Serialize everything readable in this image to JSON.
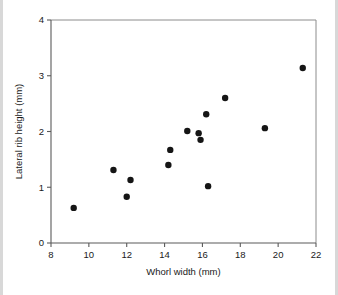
{
  "chart_data": {
    "type": "scatter",
    "title": "",
    "subtitle": "",
    "xlabel": "Whorl width (mm)",
    "ylabel": "Lateral rib height (mm)",
    "xlim": [
      8,
      22
    ],
    "ylim": [
      0,
      4
    ],
    "xticks": [
      8,
      10,
      12,
      14,
      16,
      18,
      20,
      22
    ],
    "yticks": [
      0,
      1,
      2,
      3,
      4
    ],
    "xtick_labels": [
      "8",
      "10",
      "12",
      "14",
      "16",
      "18",
      "20",
      "22"
    ],
    "ytick_labels": [
      "0",
      "1",
      "2",
      "3",
      "4"
    ],
    "grid": false,
    "legend": null,
    "legend_position": "none",
    "marker": "filled-circle",
    "marker_color": "#151515",
    "marker_size": 3.2,
    "n_points": 14,
    "points": [
      {
        "x": 9.2,
        "y": 0.63
      },
      {
        "x": 11.3,
        "y": 1.31
      },
      {
        "x": 12.0,
        "y": 0.83
      },
      {
        "x": 12.2,
        "y": 1.13
      },
      {
        "x": 14.2,
        "y": 1.4
      },
      {
        "x": 14.3,
        "y": 1.67
      },
      {
        "x": 15.2,
        "y": 2.01
      },
      {
        "x": 15.8,
        "y": 1.97
      },
      {
        "x": 15.9,
        "y": 1.85
      },
      {
        "x": 16.2,
        "y": 2.31
      },
      {
        "x": 16.3,
        "y": 1.02
      },
      {
        "x": 17.2,
        "y": 2.6
      },
      {
        "x": 19.3,
        "y": 2.06
      },
      {
        "x": 21.3,
        "y": 3.14
      }
    ],
    "x_values": [
      9.2,
      11.3,
      12.0,
      12.2,
      14.2,
      14.3,
      15.2,
      15.8,
      15.9,
      16.2,
      16.3,
      17.2,
      19.3,
      21.3
    ],
    "y_values": [
      0.63,
      1.31,
      0.83,
      1.13,
      1.4,
      1.67,
      2.01,
      1.97,
      1.85,
      2.31,
      1.02,
      2.6,
      2.06,
      3.14
    ],
    "annotations": []
  },
  "colors": {
    "background": "#ffffff",
    "marker": "#151515",
    "axis": "#5a5a5a",
    "frame": "#8c8c8c",
    "text": "#1a1a1a",
    "edge_band": "#d8d8d8"
  },
  "layout": {
    "plot_left_px": 51,
    "plot_right_px": 316,
    "plot_top_px": 20,
    "plot_bottom_px": 243
  }
}
